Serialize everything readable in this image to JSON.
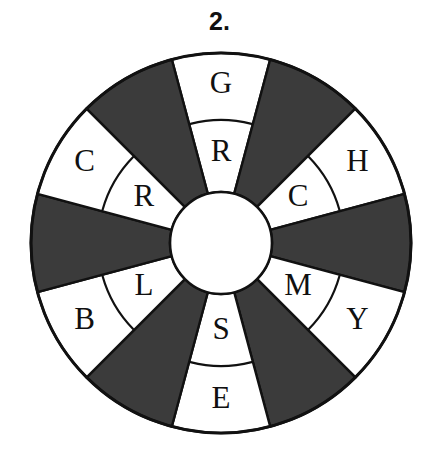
{
  "figure": {
    "label": "2.",
    "type": "letter-wheel-puzzle"
  },
  "wheel": {
    "center_x": 221,
    "center_y": 243,
    "outer_radius": 190,
    "hub_radius": 51,
    "split_radius": 123,
    "sector_count": 12,
    "sector_degrees": 30,
    "colors": {
      "shaded": "#3b3b3b",
      "unshaded": "#ffffff",
      "outline": "#111111",
      "hub": "#ffffff",
      "background": "#ffffff"
    },
    "sectors": [
      {
        "index": 0,
        "position": "top",
        "center_angle_deg": 0,
        "shaded": false,
        "inner_letter": "R",
        "outer_letter": "G"
      },
      {
        "index": 1,
        "position": "upper-right",
        "center_angle_deg": 30,
        "shaded": true,
        "inner_letter": "",
        "outer_letter": ""
      },
      {
        "index": 2,
        "position": "right-upper",
        "center_angle_deg": 60,
        "shaded": false,
        "inner_letter": "C",
        "outer_letter": "H"
      },
      {
        "index": 3,
        "position": "right",
        "center_angle_deg": 90,
        "shaded": true,
        "inner_letter": "",
        "outer_letter": ""
      },
      {
        "index": 4,
        "position": "right-lower",
        "center_angle_deg": 120,
        "shaded": false,
        "inner_letter": "M",
        "outer_letter": "Y"
      },
      {
        "index": 5,
        "position": "lower-right",
        "center_angle_deg": 150,
        "shaded": true,
        "inner_letter": "",
        "outer_letter": ""
      },
      {
        "index": 6,
        "position": "bottom",
        "center_angle_deg": 180,
        "shaded": false,
        "inner_letter": "S",
        "outer_letter": "E"
      },
      {
        "index": 7,
        "position": "lower-left",
        "center_angle_deg": 210,
        "shaded": true,
        "inner_letter": "",
        "outer_letter": ""
      },
      {
        "index": 8,
        "position": "left-lower",
        "center_angle_deg": 240,
        "shaded": false,
        "inner_letter": "L",
        "outer_letter": "B"
      },
      {
        "index": 9,
        "position": "left",
        "center_angle_deg": 270,
        "shaded": true,
        "inner_letter": "",
        "outer_letter": ""
      },
      {
        "index": 10,
        "position": "left-upper",
        "center_angle_deg": 300,
        "shaded": false,
        "inner_letter": "R",
        "outer_letter": "C"
      },
      {
        "index": 11,
        "position": "upper-left",
        "center_angle_deg": 330,
        "shaded": true,
        "inner_letter": "",
        "outer_letter": ""
      }
    ]
  }
}
